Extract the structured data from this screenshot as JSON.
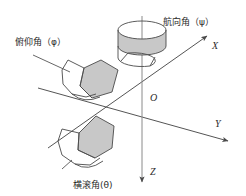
{
  "figure": {
    "kind": "3d-axis-attitude-angle-diagram",
    "background_color": "#ffffff",
    "line_color": "#555555",
    "ribbon_fill_color": "#c8c8c8",
    "ribbon_stroke_color": "#4a4a4a",
    "text_color": "#2b2b2b"
  },
  "axes": [
    {
      "id": "x",
      "label": "X",
      "direction": "up-right"
    },
    {
      "id": "y",
      "label": "Y",
      "direction": "down-right"
    },
    {
      "id": "z",
      "label": "Z",
      "direction": "down"
    }
  ],
  "origin": {
    "label": "O"
  },
  "annotations": [
    {
      "id": "yaw",
      "label": "航向角（ψ）",
      "symbol": "ψ",
      "axis": "z"
    },
    {
      "id": "pitch",
      "label": "俯仰角（φ）",
      "symbol": "φ",
      "axis": "y"
    },
    {
      "id": "roll",
      "label": "横滚角(θ)",
      "symbol": "θ",
      "axis": "x"
    }
  ]
}
